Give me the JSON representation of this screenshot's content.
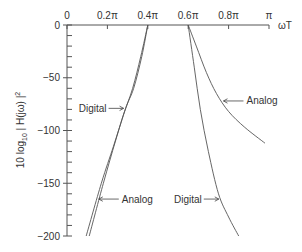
{
  "chart_data": {
    "type": "line",
    "title": "",
    "xlabel": "ωT",
    "ylabel": "10 log10 | H(jω) |²",
    "ylabel_parts": {
      "pre": "10 log",
      "sub": "10",
      "post": " | H(jω) |",
      "sup": "2"
    },
    "x_unit": "π",
    "xlim": [
      0,
      1
    ],
    "ylim": [
      -200,
      0
    ],
    "x_ticks": [
      {
        "value": 0,
        "label": "0"
      },
      {
        "value": 0.2,
        "label": "0.2π"
      },
      {
        "value": 0.4,
        "label": "0.4π"
      },
      {
        "value": 0.6,
        "label": "0.6π"
      },
      {
        "value": 0.8,
        "label": "0.8π"
      },
      {
        "value": 1.0,
        "label": "π"
      }
    ],
    "y_major_ticks": [
      {
        "value": 0,
        "label": "0"
      },
      {
        "value": -50,
        "label": "−50"
      },
      {
        "value": -100,
        "label": "−100"
      },
      {
        "value": -150,
        "label": "−150"
      },
      {
        "value": -200,
        "label": "−200"
      }
    ],
    "y_minor_step": 10,
    "grid": false,
    "series": [
      {
        "name": "Digital (lower stopband)",
        "label": "Digital",
        "x": [
          0.4,
          0.37,
          0.33,
          0.29,
          0.24,
          0.18,
          0.11
        ],
        "y": [
          0,
          -30,
          -60,
          -79,
          -110,
          -150,
          -200
        ]
      },
      {
        "name": "Analog (lower stopband)",
        "label": "Analog",
        "x": [
          0.4,
          0.365,
          0.325,
          0.28,
          0.23,
          0.17,
          0.095
        ],
        "y": [
          0,
          -30,
          -60,
          -85,
          -115,
          -150,
          -200
        ]
      },
      {
        "name": "Digital (upper stopband)",
        "label": "Digital",
        "x": [
          0.6,
          0.63,
          0.66,
          0.7,
          0.75,
          0.8,
          0.85
        ],
        "y": [
          0,
          -40,
          -80,
          -120,
          -160,
          -182,
          -200
        ]
      },
      {
        "name": "Analog (upper stopband)",
        "label": "Analog",
        "x": [
          0.6,
          0.64,
          0.69,
          0.74,
          0.8,
          0.88,
          0.98
        ],
        "y": [
          0,
          -20,
          -45,
          -65,
          -82,
          -97,
          -112
        ]
      }
    ],
    "annotations": [
      {
        "text": "Digital",
        "series": 0,
        "at_y": -79,
        "side": "left"
      },
      {
        "text": "Analog",
        "series": 1,
        "at_y": -165,
        "side": "right"
      },
      {
        "text": "Analog",
        "series": 3,
        "at_y": -72,
        "side": "right"
      },
      {
        "text": "Digital",
        "series": 2,
        "at_y": -165,
        "side": "left"
      }
    ]
  }
}
